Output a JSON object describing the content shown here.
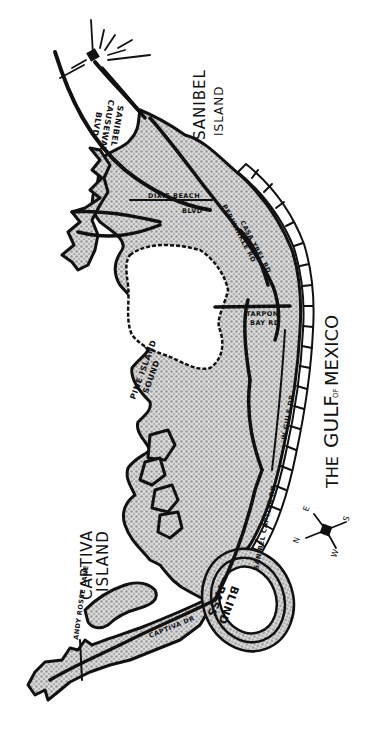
{
  "map": {
    "style": "hand-drawn halftone island map",
    "colors": {
      "ink": "#111111",
      "land_dots": "#9a9a9a",
      "background": "#ffffff"
    },
    "regions": {
      "sanibel_island": "SANIBEL ISLAND",
      "sanibel_island_line1": "SANIBEL",
      "sanibel_island_line2": "ISLAND",
      "captiva_island_line1": "CAPTIVA",
      "captiva_island_line2": "ISLAND",
      "pine_island_sound_line1": "PINE ISLAND",
      "pine_island_sound_line2": "SOUND",
      "blind_pass_line1": "BLIND",
      "blind_pass_line2": "PASS",
      "gulf_the": "THE",
      "gulf_gulf": "GULF",
      "gulf_of": "OF",
      "gulf_mexico": "MEXICO"
    },
    "roads": {
      "causeway_line1": "SANIBEL",
      "causeway_line2": "CAUSEWAY",
      "causeway_line3": "BLVD",
      "dixie_beach_line1": "DIXIE BEACH",
      "dixie_beach_line2": "BLVD",
      "periwinkle": "PERIWINKLE RD",
      "casa_ybel": "CASA YBEL RD",
      "tarpon_bay_line1": "TARPON",
      "tarpon_bay_line2": "BAY RD",
      "w_gulf_dr": "W GULF DR",
      "sanibel_captiva_rd": "SANIBEL CAPTIVA RD",
      "captiva_dr": "CAPTIVA DR",
      "andy_rosse_lane": "ANDY ROSSE LANE"
    },
    "compass": {
      "n": "N",
      "e": "E",
      "s": "S",
      "w": "W"
    },
    "landmarks": [
      "lighthouse-icon"
    ]
  }
}
